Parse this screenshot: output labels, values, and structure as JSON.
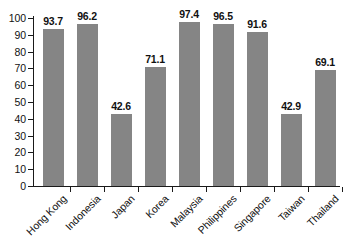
{
  "chart_data": {
    "type": "bar",
    "title": "",
    "subtitle": "",
    "xlabel": "",
    "ylabel": "",
    "ylim": [
      0,
      100
    ],
    "ytick_step": 10,
    "yticks": [
      0,
      10,
      20,
      30,
      40,
      50,
      60,
      70,
      80,
      90,
      100
    ],
    "grid": false,
    "legend": false,
    "legend_position": "none",
    "categories": [
      "Hong Kong",
      "Indonesia",
      "Japan",
      "Korea",
      "Malaysia",
      "Philippines",
      "Singapore",
      "Taiwan",
      "Thailand"
    ],
    "values": [
      93.7,
      96.2,
      42.6,
      71.1,
      97.4,
      96.5,
      91.6,
      42.9,
      69.1
    ],
    "value_labels": [
      "93.7",
      "96.2",
      "42.6",
      "71.1",
      "97.4",
      "96.5",
      "91.6",
      "42.9",
      "69.1"
    ],
    "bar_color": "#858585",
    "axis_color": "#1a1a1a",
    "text_color": "#111111",
    "background_color": "#ffffff"
  }
}
